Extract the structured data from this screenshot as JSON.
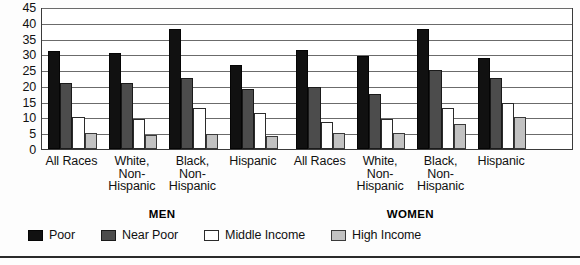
{
  "chart_data": {
    "type": "bar",
    "title": "",
    "xlabel": "",
    "ylabel": "",
    "ylim": [
      0,
      45
    ],
    "yticks": [
      0,
      5,
      10,
      15,
      20,
      25,
      30,
      35,
      40,
      45
    ],
    "grid": true,
    "legend_position": "bottom-left",
    "group_labels": [
      "MEN",
      "WOMEN"
    ],
    "categories": [
      "All Races",
      "White, Non-Hispanic",
      "Black, Non-Hispanic",
      "Hispanic",
      "All Races",
      "White, Non-Hispanic",
      "Black, Non-Hispanic",
      "Hispanic"
    ],
    "category_lines": [
      [
        "All Races"
      ],
      [
        "White,",
        "Non-",
        "Hispanic"
      ],
      [
        "Black,",
        "Non-",
        "Hispanic"
      ],
      [
        "Hispanic"
      ],
      [
        "All Races"
      ],
      [
        "White,",
        "Non-",
        "Hispanic"
      ],
      [
        "Black,",
        "Non-",
        "Hispanic"
      ],
      [
        "Hispanic"
      ]
    ],
    "series": [
      {
        "name": "Poor",
        "color": "#111111",
        "values": [
          31.0,
          30.5,
          38.0,
          26.5,
          31.5,
          29.5,
          38.0,
          29.0
        ]
      },
      {
        "name": "Near Poor",
        "color": "#4c4c4c",
        "values": [
          21.0,
          21.0,
          22.5,
          19.0,
          19.5,
          17.5,
          25.0,
          22.5
        ]
      },
      {
        "name": "Middle Income",
        "color": "#ffffff",
        "values": [
          10.0,
          9.5,
          13.0,
          11.5,
          8.5,
          9.5,
          13.0,
          14.5
        ]
      },
      {
        "name": "High Income",
        "color": "#c2c2c2",
        "values": [
          5.0,
          4.5,
          4.7,
          4.2,
          5.0,
          5.0,
          8.0,
          10.0
        ]
      }
    ]
  },
  "legend": {
    "items": [
      {
        "label": "Poor",
        "swatch": "poor"
      },
      {
        "label": "Near Poor",
        "swatch": "near"
      },
      {
        "label": "Middle Income",
        "swatch": "middle"
      },
      {
        "label": "High Income",
        "swatch": "high"
      }
    ]
  }
}
